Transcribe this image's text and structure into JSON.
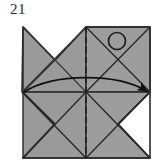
{
  "figure": {
    "step_number": "21",
    "kind": "origami-folding-diagram",
    "canvas": {
      "width": 163,
      "height": 167
    },
    "colors": {
      "paper_fill": "#9a9a9a",
      "paper_fill_alt": "#a2a2a2",
      "outline": "#2a2a2a",
      "crease_line": "#4a4a4a",
      "background": "#ffffff",
      "label_text": "#2b2b2b",
      "arrow": "#111111",
      "marker_circle": "#1c1c1c"
    },
    "geometry": {
      "top_left": {
        "x": 23,
        "y": 27
      },
      "top_mid": {
        "x": 86,
        "y": 27
      },
      "top_right": {
        "x": 150,
        "y": 27
      },
      "left_waist": {
        "x": 22,
        "y": 92
      },
      "center": {
        "x": 86,
        "y": 92
      },
      "right_waist": {
        "x": 150,
        "y": 92
      },
      "bottom_left": {
        "x": 23,
        "y": 158
      },
      "bottom_mid": {
        "x": 86,
        "y": 158
      },
      "bottom_right": {
        "x": 150,
        "y": 158
      },
      "notch_top_left_apex": {
        "x": 55,
        "y": 60
      },
      "notch_bottom_left_apex": {
        "x": 55,
        "y": 124
      },
      "notch_bottom_right_apex": {
        "x": 118,
        "y": 124
      }
    },
    "elements": {
      "step_label": "21",
      "valley_fold_line": "vertical-dashed-center-line",
      "marker_circle_label": "rotation-marker-circle",
      "fold_arrow_label": "curved-fold-arrow-left-to-right"
    }
  }
}
